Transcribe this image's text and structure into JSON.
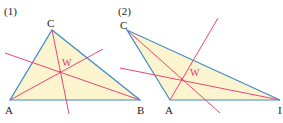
{
  "colors": {
    "fill": "#fbf4cf",
    "edge": "#3d8cc8",
    "line": "#e8477a",
    "text": "#222222"
  },
  "figures": [
    {
      "label": "(1)",
      "vertices": {
        "A": "A",
        "B": "B",
        "C": "C"
      },
      "point": "W"
    },
    {
      "label": "(2)",
      "vertices": {
        "A": "A",
        "B": "I",
        "C": "C"
      },
      "point": "W"
    }
  ]
}
